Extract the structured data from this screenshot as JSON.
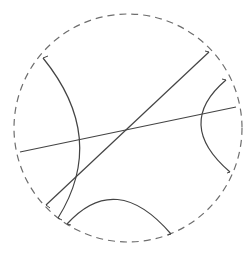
{
  "diagram": {
    "type": "poincare-disk",
    "background": "#ffffff",
    "boundary": {
      "cx": 128,
      "cy": 128,
      "r": 114,
      "stroke": "#6e6e6e",
      "style": "dashed",
      "dash": "7 5"
    },
    "geodesic_color": "#444444",
    "lines": [
      {
        "id": "diameter-shallow",
        "x1": 20,
        "y1": 152,
        "x2": 236,
        "y2": 107
      },
      {
        "id": "diameter-steep",
        "x1": 46,
        "y1": 205,
        "x2": 209,
        "y2": 52
      }
    ],
    "arcs": [
      {
        "id": "arc-left",
        "d": "M 43 58 Q 108 138 58 218"
      },
      {
        "id": "arc-right",
        "d": "M 226 80 Q 174 124 230 172"
      },
      {
        "id": "arc-bottom",
        "d": "M 67 224 Q 116 170 171 234"
      }
    ],
    "endpoint_ticks": [
      {
        "x1": 43,
        "y1": 58,
        "x2": 48,
        "y2": 56
      },
      {
        "x1": 46,
        "y1": 205,
        "x2": 50,
        "y2": 208
      },
      {
        "x1": 58,
        "y1": 218,
        "x2": 62,
        "y2": 220
      },
      {
        "x1": 67,
        "y1": 224,
        "x2": 71,
        "y2": 225
      },
      {
        "x1": 209,
        "y1": 52,
        "x2": 205,
        "y2": 51
      },
      {
        "x1": 226,
        "y1": 80,
        "x2": 222,
        "y2": 79
      },
      {
        "x1": 230,
        "y1": 172,
        "x2": 227,
        "y2": 173
      },
      {
        "x1": 171,
        "y1": 234,
        "x2": 168,
        "y2": 235
      }
    ]
  }
}
